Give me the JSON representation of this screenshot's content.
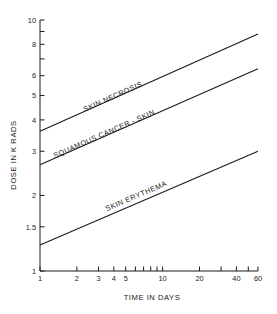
{
  "chart_data": {
    "type": "line",
    "title": "",
    "xlabel": "TIME IN DAYS",
    "ylabel": "DOSE IN K RADS",
    "xscale": "log",
    "yscale": "log",
    "xlim": [
      1,
      60
    ],
    "ylim": [
      1,
      10
    ],
    "grid": false,
    "legend": "inline-labels",
    "xticks_labeled": [
      "1",
      "2",
      "3",
      "4",
      "5",
      "10",
      "20",
      "40",
      "60"
    ],
    "xtick_values": [
      1,
      2,
      3,
      4,
      5,
      10,
      20,
      40,
      60
    ],
    "xticks_minor": [
      6,
      7,
      8,
      9,
      30,
      50
    ],
    "yticks_labeled": [
      "1",
      "1.5",
      "2",
      "3",
      "4",
      "5",
      "6",
      "8",
      "10"
    ],
    "ytick_values": [
      1,
      1.5,
      2,
      3,
      4,
      5,
      6,
      8,
      10
    ],
    "series": [
      {
        "name": "SKIN NECROSIS",
        "label": "SKIN NECROSIS",
        "x": [
          1,
          60
        ],
        "values": [
          3.6,
          8.8
        ],
        "label_x": 4.0,
        "label_y": 4.85
      },
      {
        "name": "SQUAMOUS CANCER - SKIN",
        "label": "SQUAMOUS CANCER - SKIN",
        "x": [
          1,
          60
        ],
        "values": [
          2.65,
          6.4
        ],
        "label_x": 3.4,
        "label_y": 3.45
      },
      {
        "name": "SKIN ERYTHEMA",
        "label": "SKIN ERYTHEMA",
        "x": [
          1,
          60
        ],
        "values": [
          1.27,
          3.0
        ],
        "label_x": 6.2,
        "label_y": 1.95
      }
    ]
  },
  "axes": {
    "x_title": "TIME IN DAYS",
    "y_title": "DOSE IN K RADS"
  },
  "colors": {
    "ink": "#1a1a1a",
    "background": "#ffffff"
  }
}
